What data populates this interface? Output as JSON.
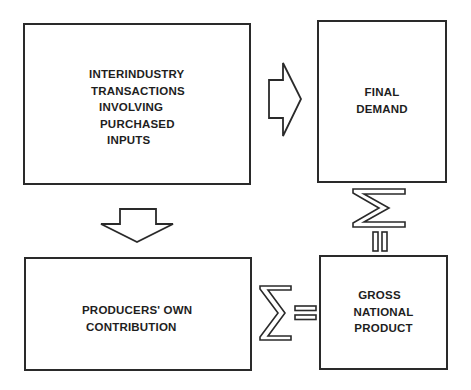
{
  "diagram": {
    "boxes": [
      {
        "id": "interindustry",
        "lines": [
          "INTERINDUSTRY",
          "TRANSACTIONS",
          "INVOLVING",
          "PURCHASED",
          "INPUTS"
        ]
      },
      {
        "id": "final-demand",
        "lines": [
          "FINAL",
          "DEMAND"
        ]
      },
      {
        "id": "producers-own",
        "lines": [
          "PRODUCERS' OWN",
          "CONTRIBUTION"
        ]
      },
      {
        "id": "gnp",
        "lines": [
          "GROSS",
          "NATIONAL",
          "PRODUCT"
        ]
      }
    ],
    "connectors": [
      {
        "from": "interindustry",
        "to": "final-demand",
        "type": "block-arrow-right"
      },
      {
        "from": "interindustry",
        "to": "producers-own",
        "type": "block-arrow-down"
      },
      {
        "from": "final-demand",
        "to": "gnp",
        "type": "sigma-equals-vertical",
        "symbols": [
          "Σ",
          "="
        ]
      },
      {
        "from": "producers-own",
        "to": "gnp",
        "type": "sigma-equals-horizontal",
        "symbols": [
          "Σ",
          "="
        ]
      }
    ],
    "stroke_color": "#2a2a2a",
    "background": "#ffffff"
  }
}
